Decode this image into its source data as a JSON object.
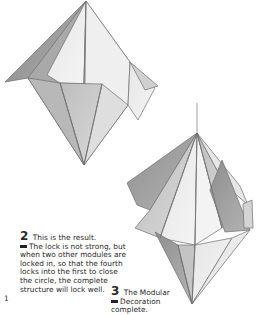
{
  "page": {
    "page_number": "1",
    "steps": [
      {
        "number": "2",
        "first_line": "This is the result.",
        "text": "The lock is not strong, but when two other modules are locked in, so that the fourth locks into the first to close the circle, the complete structure will lock well."
      },
      {
        "number": "3",
        "first_line": "The Modular",
        "text": "Decoration complete."
      }
    ],
    "illustrations": [
      {
        "label": "origami-module-locked-result"
      },
      {
        "label": "modular-decoration-complete"
      }
    ]
  }
}
